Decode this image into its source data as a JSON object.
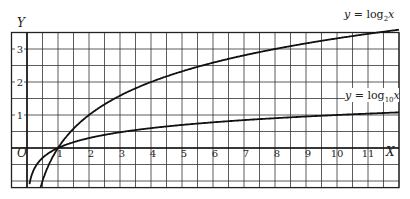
{
  "chart_data": {
    "type": "line",
    "title": "",
    "xlabel": "X",
    "ylabel": "Y",
    "origin_label": "O",
    "x_ticks": [
      "1",
      "2",
      "3",
      "4",
      "5",
      "6",
      "7",
      "8",
      "9",
      "10",
      "11"
    ],
    "y_ticks": [
      "1",
      "2",
      "3"
    ],
    "xlim": [
      -0.5,
      12
    ],
    "ylim": [
      -1.2,
      3.5
    ],
    "grid": true,
    "grid_step": 0.5,
    "series": [
      {
        "name": "y = log2 x",
        "label": "y = log₂x",
        "x": [
          0.5,
          1,
          2,
          3,
          4,
          5,
          6,
          7,
          8,
          9,
          10,
          11,
          12
        ],
        "values": [
          -1,
          0,
          1,
          1.585,
          2,
          2.322,
          2.585,
          2.807,
          3,
          3.17,
          3.322,
          3.459,
          3.585
        ]
      },
      {
        "name": "y = log10 x",
        "label": "y = log₁₀x",
        "x": [
          0.1,
          1,
          2,
          3,
          4,
          5,
          6,
          7,
          8,
          9,
          10,
          11,
          12
        ],
        "values": [
          -1,
          0,
          0.301,
          0.477,
          0.602,
          0.699,
          0.778,
          0.845,
          0.903,
          0.954,
          1,
          1.041,
          1.079
        ]
      }
    ],
    "annotations": [
      "y = log₂x",
      "y = log₁₀x"
    ]
  },
  "labels": {
    "y_axis": "Y",
    "x_axis": "X",
    "origin": "O",
    "log2_prefix": "y = log",
    "log2_sub": "2",
    "log2_suffix": "x",
    "log10_prefix": "y = log",
    "log10_sub": "10",
    "log10_suffix": "x"
  }
}
